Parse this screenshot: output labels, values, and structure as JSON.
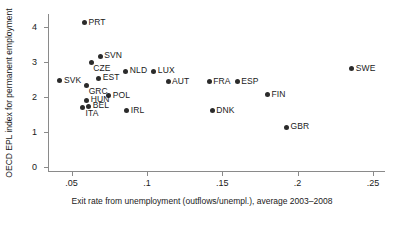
{
  "chart_data": {
    "type": "scatter",
    "title": "",
    "xlabel": "Exit rate from unemployment (outflows/unempl.), average 2003–2008",
    "ylabel": "OECD EPL index for permanent employment",
    "xlim": [
      0.035,
      0.258
    ],
    "ylim": [
      -0.12,
      4.36
    ],
    "xticks": [
      0.05,
      0.1,
      0.15,
      0.2,
      0.25
    ],
    "xticklabels": [
      ".05",
      ".1",
      ".15",
      ".2",
      ".25"
    ],
    "yticks": [
      0,
      1,
      2,
      3,
      4
    ],
    "yticklabels": [
      "0",
      "1",
      "2",
      "3",
      "4"
    ],
    "grid": false,
    "legend": false,
    "marker_color": "#2b2b2b",
    "axis_color": "#8a8a8a",
    "points": [
      {
        "label": "PRT",
        "x": 0.0585,
        "y": 4.11,
        "pos": "right"
      },
      {
        "label": "SVN",
        "x": 0.069,
        "y": 3.15,
        "pos": "right"
      },
      {
        "label": "CZE",
        "x": 0.063,
        "y": 2.97,
        "pos": "below-right"
      },
      {
        "label": "NLD",
        "x": 0.086,
        "y": 2.73,
        "pos": "right"
      },
      {
        "label": "LUX",
        "x": 0.1046,
        "y": 2.73,
        "pos": "right"
      },
      {
        "label": "SVK",
        "x": 0.0423,
        "y": 2.45,
        "pos": "right"
      },
      {
        "label": "EST",
        "x": 0.068,
        "y": 2.52,
        "pos": "right"
      },
      {
        "label": "AUT",
        "x": 0.114,
        "y": 2.42,
        "pos": "right"
      },
      {
        "label": "FRA",
        "x": 0.1413,
        "y": 2.43,
        "pos": "right"
      },
      {
        "label": "ESP",
        "x": 0.16,
        "y": 2.43,
        "pos": "right"
      },
      {
        "label": "GRC",
        "x": 0.06,
        "y": 2.31,
        "pos": "below-right"
      },
      {
        "label": "SWE",
        "x": 0.236,
        "y": 2.8,
        "pos": "right"
      },
      {
        "label": "FIN",
        "x": 0.18,
        "y": 2.05,
        "pos": "right"
      },
      {
        "label": "POL",
        "x": 0.0746,
        "y": 2.03,
        "pos": "right"
      },
      {
        "label": "HUN",
        "x": 0.06,
        "y": 1.9,
        "pos": "right"
      },
      {
        "label": "BEL",
        "x": 0.0613,
        "y": 1.73,
        "pos": "right"
      },
      {
        "label": "ITA",
        "x": 0.0573,
        "y": 1.69,
        "pos": "below-left"
      },
      {
        "label": "IRL",
        "x": 0.0866,
        "y": 1.6,
        "pos": "right"
      },
      {
        "label": "DNK",
        "x": 0.1433,
        "y": 1.6,
        "pos": "right"
      },
      {
        "label": "GBR",
        "x": 0.1926,
        "y": 1.13,
        "pos": "right"
      }
    ]
  }
}
